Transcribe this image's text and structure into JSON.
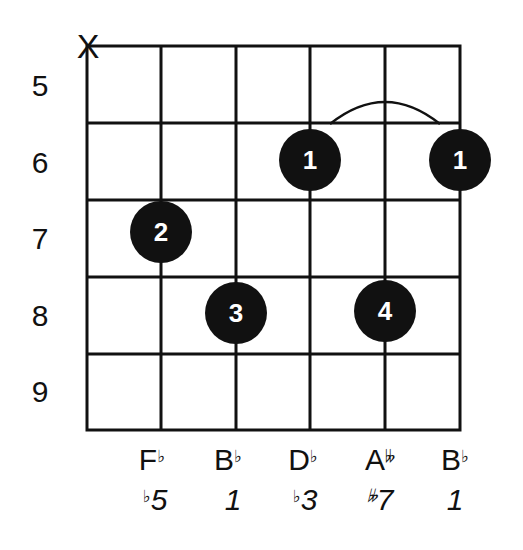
{
  "chord_diagram": {
    "type": "guitar-chord-chart",
    "muted_strings": [
      {
        "string": 6,
        "symbol": "X"
      }
    ],
    "fret_numbers": [
      "5",
      "6",
      "7",
      "8",
      "9"
    ],
    "barre": {
      "finger": "1",
      "fret": 6,
      "from_string": 3,
      "to_string": 1
    },
    "fingers": [
      {
        "finger": "1",
        "string": 3,
        "fret": 6
      },
      {
        "finger": "1",
        "string": 1,
        "fret": 6
      },
      {
        "finger": "2",
        "string": 5,
        "fret": 7
      },
      {
        "finger": "3",
        "string": 4,
        "fret": 8
      },
      {
        "finger": "4",
        "string": 2,
        "fret": 8
      }
    ],
    "notes": [
      {
        "letter": "F",
        "accidental": "♭"
      },
      {
        "letter": "B",
        "accidental": "♭"
      },
      {
        "letter": "D",
        "accidental": "♭"
      },
      {
        "letter": "A",
        "accidental": "𝄫"
      },
      {
        "letter": "B",
        "accidental": "♭"
      }
    ],
    "intervals": [
      {
        "accidental": "♭",
        "degree": "5"
      },
      {
        "accidental": "",
        "degree": "1"
      },
      {
        "accidental": "♭",
        "degree": "3"
      },
      {
        "accidental": "𝄫",
        "degree": "7"
      },
      {
        "accidental": "",
        "degree": "1"
      }
    ],
    "colors": {
      "line": "#111111",
      "dot": "#111111",
      "dot_text": "#ffffff",
      "background": "#ffffff"
    }
  }
}
